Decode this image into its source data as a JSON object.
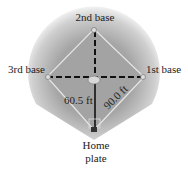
{
  "diagram": {
    "labels": {
      "second_base": "2nd base",
      "third_base": "3rd base",
      "first_base": "1st base",
      "home_line1": "Home",
      "home_line2": "plate",
      "pitch_distance": "60.5 ft",
      "base_distance": "90.0 ft"
    },
    "colors": {
      "field_outer": "#f2f2f2",
      "field_inner": "#9a9a9a",
      "infield": "#a8a8a8",
      "base_path": "#e8e8e8",
      "dash_line": "#111111",
      "text": "#222222"
    }
  }
}
